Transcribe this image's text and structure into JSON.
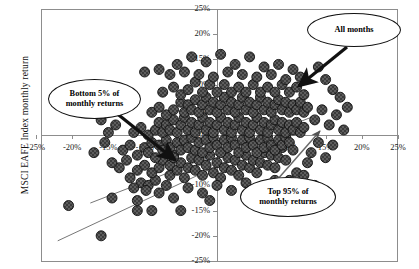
{
  "chart_data": {
    "type": "scatter",
    "title": "",
    "xlabel": "",
    "ylabel": "MSCI EAFE Index monthly return",
    "xlim": [
      -25,
      25
    ],
    "ylim": [
      -25,
      25
    ],
    "xticks": [
      "-25%",
      "-20%",
      "-15%",
      "-10%",
      "-5%",
      "0%",
      "5%",
      "10%",
      "15%",
      "20%",
      "25%"
    ],
    "xtick_values": [
      -25,
      -20,
      -15,
      -10,
      -5,
      0,
      5,
      10,
      15,
      20,
      25
    ],
    "yticks": [
      "25%",
      "20%",
      "15%",
      "10%",
      "5%",
      "0%",
      "-5%",
      "-10%",
      "-15%",
      "-20%",
      "-25%"
    ],
    "ytick_values": [
      25,
      20,
      15,
      10,
      5,
      0,
      -5,
      -10,
      -15,
      -20,
      -25
    ],
    "grid": false,
    "legend": "none",
    "marker": {
      "shape": "circle",
      "color": "#3a3a3a",
      "edge_color": "#111111",
      "size_px": 10
    },
    "annotations": [
      {
        "name": "bottom-5-callout",
        "text_line1": "Bottom 5% of",
        "text_line2": "monthly returns"
      },
      {
        "name": "all-months-callout",
        "text_line1": "All months",
        "text_line2": ""
      },
      {
        "name": "top-95-callout",
        "text_line1": "Top 95% of",
        "text_line2": "monthly returns"
      }
    ],
    "trend_lines": [
      {
        "name": "lower-boundary-line",
        "x1": -22.0,
        "y1": -21.0,
        "x2": 8.5,
        "y2": -0.5
      },
      {
        "name": "upper-boundary-line",
        "x1": -17.5,
        "y1": -13.5,
        "x2": 13.0,
        "y2": 3.5
      }
    ],
    "points": [
      [
        -20.5,
        -14.0
      ],
      [
        -16.0,
        -20.0
      ],
      [
        -14.5,
        -12.5
      ],
      [
        -11.0,
        -15.0
      ],
      [
        -9.0,
        -15.0
      ],
      [
        -10.5,
        -9.5
      ],
      [
        -9.5,
        -10.0
      ],
      [
        -8.5,
        -9.0
      ],
      [
        -9.8,
        -11.0
      ],
      [
        -8.0,
        -11.5
      ],
      [
        -11.5,
        -10.5
      ],
      [
        -7.0,
        -10.0
      ],
      [
        -12.0,
        -8.5
      ],
      [
        -5.0,
        -15.0
      ],
      [
        -6.5,
        -8.0
      ],
      [
        -13.5,
        -6.5
      ],
      [
        -12.5,
        -5.0
      ],
      [
        -11.0,
        -7.0
      ],
      [
        -10.0,
        -6.0
      ],
      [
        -9.0,
        -7.5
      ],
      [
        -8.0,
        -6.5
      ],
      [
        -7.5,
        -5.0
      ],
      [
        -6.5,
        -6.0
      ],
      [
        -6.0,
        -4.0
      ],
      [
        -5.5,
        -7.0
      ],
      [
        -5.0,
        -5.5
      ],
      [
        -4.5,
        -8.5
      ],
      [
        -4.0,
        -6.5
      ],
      [
        -3.5,
        -4.5
      ],
      [
        -3.0,
        -7.0
      ],
      [
        -2.5,
        -5.0
      ],
      [
        -2.0,
        -8.0
      ],
      [
        -1.5,
        -6.0
      ],
      [
        -1.0,
        -4.0
      ],
      [
        -0.5,
        -7.5
      ],
      [
        0.0,
        -5.5
      ],
      [
        0.5,
        -8.5
      ],
      [
        1.0,
        -6.5
      ],
      [
        1.5,
        -4.5
      ],
      [
        2.0,
        -7.0
      ],
      [
        2.5,
        -5.0
      ],
      [
        3.0,
        -8.0
      ],
      [
        3.5,
        -6.0
      ],
      [
        4.0,
        -4.0
      ],
      [
        4.5,
        -6.5
      ],
      [
        5.0,
        -5.0
      ],
      [
        5.5,
        -7.5
      ],
      [
        6.0,
        -5.5
      ],
      [
        6.5,
        -3.5
      ],
      [
        7.0,
        -6.0
      ],
      [
        7.5,
        -4.0
      ],
      [
        8.0,
        -6.5
      ],
      [
        8.5,
        -4.5
      ],
      [
        9.0,
        -2.5
      ],
      [
        9.5,
        -5.0
      ],
      [
        -13.0,
        -3.0
      ],
      [
        -12.0,
        -2.0
      ],
      [
        -11.0,
        -4.0
      ],
      [
        -10.0,
        -2.5
      ],
      [
        -9.5,
        -3.5
      ],
      [
        -9.0,
        -1.5
      ],
      [
        -8.5,
        -4.5
      ],
      [
        -8.0,
        -2.0
      ],
      [
        -7.5,
        -3.0
      ],
      [
        -7.0,
        -1.0
      ],
      [
        -6.5,
        -2.5
      ],
      [
        -6.0,
        -4.5
      ],
      [
        -5.5,
        -1.5
      ],
      [
        -5.0,
        -3.0
      ],
      [
        -4.5,
        -1.0
      ],
      [
        -4.0,
        -2.5
      ],
      [
        -3.5,
        -0.5
      ],
      [
        -3.0,
        -3.0
      ],
      [
        -2.5,
        -1.5
      ],
      [
        -2.0,
        -3.5
      ],
      [
        -1.5,
        -1.0
      ],
      [
        -1.0,
        -2.5
      ],
      [
        -0.5,
        -0.5
      ],
      [
        0.0,
        -2.0
      ],
      [
        0.5,
        -3.5
      ],
      [
        1.0,
        -1.0
      ],
      [
        1.5,
        -2.5
      ],
      [
        2.0,
        -0.5
      ],
      [
        2.5,
        -2.0
      ],
      [
        3.0,
        -3.5
      ],
      [
        3.5,
        -1.0
      ],
      [
        4.0,
        -2.5
      ],
      [
        4.5,
        -0.5
      ],
      [
        5.0,
        -2.0
      ],
      [
        5.5,
        -3.5
      ],
      [
        6.0,
        -1.0
      ],
      [
        6.5,
        -2.5
      ],
      [
        7.0,
        -0.5
      ],
      [
        7.5,
        -2.0
      ],
      [
        8.0,
        -3.0
      ],
      [
        8.5,
        -1.0
      ],
      [
        9.0,
        -2.0
      ],
      [
        9.5,
        -0.5
      ],
      [
        10.0,
        -1.5
      ],
      [
        10.5,
        -3.0
      ],
      [
        -11.5,
        0.5
      ],
      [
        -10.5,
        1.5
      ],
      [
        -9.5,
        0.0
      ],
      [
        -8.5,
        1.0
      ],
      [
        -8.0,
        2.5
      ],
      [
        -7.5,
        0.5
      ],
      [
        -7.0,
        2.0
      ],
      [
        -6.5,
        1.0
      ],
      [
        -6.0,
        3.0
      ],
      [
        -5.5,
        0.5
      ],
      [
        -5.0,
        2.0
      ],
      [
        -4.5,
        3.5
      ],
      [
        -4.0,
        1.0
      ],
      [
        -3.5,
        2.5
      ],
      [
        -3.0,
        0.5
      ],
      [
        -2.5,
        2.0
      ],
      [
        -2.0,
        3.5
      ],
      [
        -1.5,
        1.0
      ],
      [
        -1.0,
        2.5
      ],
      [
        -0.5,
        0.5
      ],
      [
        0.0,
        2.0
      ],
      [
        0.5,
        3.5
      ],
      [
        1.0,
        1.0
      ],
      [
        1.5,
        2.5
      ],
      [
        2.0,
        0.5
      ],
      [
        2.5,
        2.0
      ],
      [
        3.0,
        3.5
      ],
      [
        3.5,
        1.0
      ],
      [
        4.0,
        2.5
      ],
      [
        4.5,
        0.5
      ],
      [
        5.0,
        2.0
      ],
      [
        5.5,
        3.5
      ],
      [
        6.0,
        1.0
      ],
      [
        6.5,
        2.5
      ],
      [
        7.0,
        0.5
      ],
      [
        7.5,
        2.0
      ],
      [
        8.0,
        3.0
      ],
      [
        8.5,
        1.0
      ],
      [
        9.0,
        2.5
      ],
      [
        9.5,
        0.5
      ],
      [
        10.0,
        2.0
      ],
      [
        10.5,
        1.0
      ],
      [
        11.0,
        2.5
      ],
      [
        11.5,
        0.5
      ],
      [
        12.0,
        1.5
      ],
      [
        -9.0,
        4.5
      ],
      [
        -8.0,
        5.5
      ],
      [
        -7.0,
        4.0
      ],
      [
        -6.0,
        5.0
      ],
      [
        -5.0,
        6.5
      ],
      [
        -4.5,
        4.5
      ],
      [
        -4.0,
        6.0
      ],
      [
        -3.5,
        5.0
      ],
      [
        -3.0,
        7.0
      ],
      [
        -2.5,
        4.5
      ],
      [
        -2.0,
        6.0
      ],
      [
        -1.5,
        7.5
      ],
      [
        -1.0,
        5.0
      ],
      [
        -0.5,
        6.5
      ],
      [
        0.0,
        4.5
      ],
      [
        0.5,
        6.0
      ],
      [
        1.0,
        7.5
      ],
      [
        1.5,
        5.0
      ],
      [
        2.0,
        6.5
      ],
      [
        2.5,
        4.5
      ],
      [
        3.0,
        6.0
      ],
      [
        3.5,
        7.5
      ],
      [
        4.0,
        5.0
      ],
      [
        4.5,
        6.5
      ],
      [
        5.0,
        4.5
      ],
      [
        5.5,
        6.0
      ],
      [
        6.0,
        7.5
      ],
      [
        6.5,
        5.0
      ],
      [
        7.0,
        6.5
      ],
      [
        7.5,
        4.5
      ],
      [
        8.0,
        6.0
      ],
      [
        8.5,
        7.0
      ],
      [
        9.0,
        5.0
      ],
      [
        9.5,
        6.5
      ],
      [
        10.0,
        4.5
      ],
      [
        10.5,
        6.0
      ],
      [
        11.0,
        5.0
      ],
      [
        11.5,
        6.5
      ],
      [
        12.0,
        4.5
      ],
      [
        12.5,
        5.5
      ],
      [
        -7.5,
        8.5
      ],
      [
        -6.0,
        9.5
      ],
      [
        -5.0,
        8.0
      ],
      [
        -4.0,
        9.0
      ],
      [
        -3.0,
        10.5
      ],
      [
        -2.0,
        8.5
      ],
      [
        -1.0,
        10.0
      ],
      [
        0.0,
        8.5
      ],
      [
        1.0,
        10.0
      ],
      [
        2.0,
        8.5
      ],
      [
        3.0,
        9.5
      ],
      [
        4.0,
        8.5
      ],
      [
        5.0,
        10.0
      ],
      [
        6.0,
        8.5
      ],
      [
        7.0,
        9.5
      ],
      [
        8.0,
        8.5
      ],
      [
        9.0,
        10.0
      ],
      [
        10.0,
        8.5
      ],
      [
        11.0,
        9.5
      ],
      [
        12.0,
        8.0
      ],
      [
        -6.5,
        12.0
      ],
      [
        -4.5,
        12.5
      ],
      [
        -2.5,
        12.0
      ],
      [
        -0.5,
        11.5
      ],
      [
        1.5,
        12.5
      ],
      [
        3.5,
        12.0
      ],
      [
        5.5,
        11.5
      ],
      [
        7.5,
        12.0
      ],
      [
        9.5,
        11.0
      ],
      [
        11.5,
        11.5
      ],
      [
        -1.5,
        14.5
      ],
      [
        2.5,
        14.0
      ],
      [
        6.5,
        13.5
      ],
      [
        -5.5,
        14.0
      ],
      [
        4.5,
        15.5
      ],
      [
        -8.0,
        13.0
      ],
      [
        8.5,
        14.0
      ],
      [
        0.5,
        16.0
      ],
      [
        -3.5,
        15.5
      ],
      [
        10.5,
        13.0
      ],
      [
        13.5,
        3.0
      ],
      [
        14.5,
        5.0
      ],
      [
        15.5,
        2.0
      ],
      [
        16.5,
        4.0
      ],
      [
        17.5,
        1.0
      ],
      [
        13.0,
        -3.5
      ],
      [
        14.0,
        -1.5
      ],
      [
        15.0,
        -4.5
      ],
      [
        16.0,
        -2.0
      ],
      [
        12.5,
        -5.5
      ],
      [
        11.0,
        -7.5
      ],
      [
        10.0,
        -9.0
      ],
      [
        12.0,
        -8.0
      ],
      [
        13.5,
        -10.0
      ],
      [
        9.5,
        -11.5
      ],
      [
        -14.0,
        2.0
      ],
      [
        -15.0,
        0.5
      ],
      [
        -16.0,
        3.0
      ],
      [
        -13.0,
        5.5
      ],
      [
        -15.5,
        -1.5
      ],
      [
        -17.0,
        -3.5
      ],
      [
        -12.5,
        8.0
      ],
      [
        -14.5,
        -5.5
      ],
      [
        -10.0,
        12.5
      ],
      [
        -11.0,
        -13.0
      ],
      [
        -4.0,
        -10.5
      ],
      [
        -2.0,
        -11.5
      ],
      [
        0.0,
        -10.0
      ],
      [
        2.0,
        -11.0
      ],
      [
        4.0,
        -9.5
      ],
      [
        6.0,
        -11.0
      ],
      [
        8.0,
        -9.0
      ],
      [
        -6.0,
        -12.5
      ],
      [
        -1.0,
        -13.0
      ],
      [
        5.0,
        -12.0
      ],
      [
        17.0,
        7.5
      ],
      [
        16.0,
        9.0
      ],
      [
        18.0,
        5.5
      ],
      [
        15.0,
        11.0
      ],
      [
        14.0,
        13.5
      ]
    ]
  },
  "axis_titles": {
    "y": "MSCI EAFE Index monthly return"
  },
  "callouts": {
    "bottom5": {
      "line1": "Bottom 5% of",
      "line2": "monthly returns"
    },
    "allmonths": {
      "line1": "All months",
      "line2": ""
    },
    "top95": {
      "line1": "Top 95% of",
      "line2": "monthly returns"
    }
  }
}
